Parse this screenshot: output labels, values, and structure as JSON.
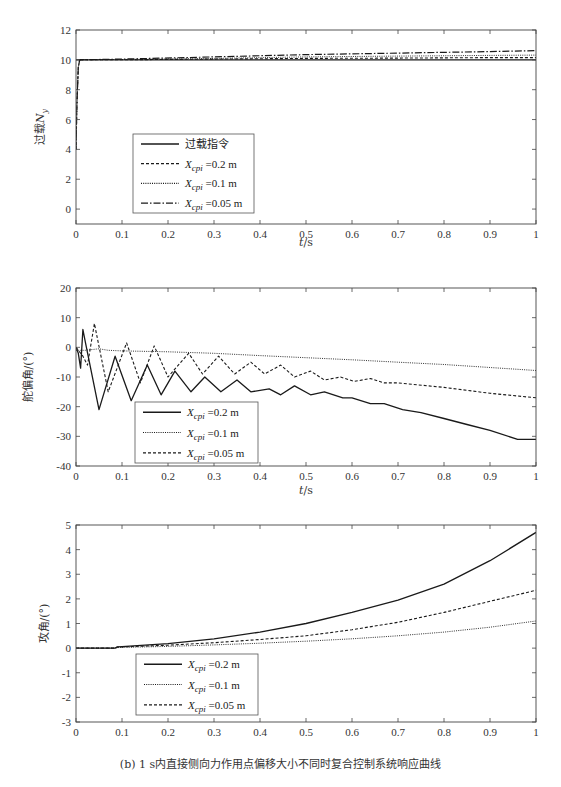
{
  "caption": "(b) 1 s内直接侧向力作用点偏移大小不同时复合控制系统响应曲线",
  "chart_data": [
    {
      "type": "line",
      "title": "",
      "xlabel": "t/s",
      "ylabel": "过载N_y",
      "xlim": [
        0,
        1
      ],
      "ylim": [
        -1,
        12
      ],
      "xticks": [
        0,
        0.1,
        0.2,
        0.3,
        0.4,
        0.5,
        0.6,
        0.7,
        0.8,
        0.9,
        1
      ],
      "yticks": [
        0,
        2,
        4,
        6,
        8,
        10,
        12
      ],
      "grid": false,
      "legend_position": "lower-left-inside",
      "series": [
        {
          "name": "过载指令",
          "style": "solid",
          "x": [
            0,
            0.004,
            0.008,
            0.05,
            1.0
          ],
          "y": [
            10,
            10,
            10,
            10,
            10
          ]
        },
        {
          "name": "X_cpi =0.2 m",
          "style": "dashed",
          "x": [
            0,
            0.002,
            0.005,
            0.008,
            0.1,
            0.3,
            0.5,
            0.7,
            0.9,
            1.0
          ],
          "y": [
            4,
            7,
            9.5,
            10,
            10.0,
            10.05,
            10.1,
            10.12,
            10.15,
            10.15
          ]
        },
        {
          "name": "X_cpi =0.1 m",
          "style": "dotted",
          "x": [
            0,
            0.002,
            0.005,
            0.008,
            0.1,
            0.3,
            0.5,
            0.7,
            0.9,
            1.0
          ],
          "y": [
            4,
            7,
            9.5,
            10,
            10.02,
            10.1,
            10.2,
            10.25,
            10.3,
            10.32
          ]
        },
        {
          "name": "X_cpi =0.05 m",
          "style": "dashdot",
          "x": [
            0,
            0.002,
            0.005,
            0.008,
            0.1,
            0.3,
            0.5,
            0.7,
            0.9,
            1.0
          ],
          "y": [
            4,
            7,
            9.5,
            10,
            10.05,
            10.2,
            10.35,
            10.45,
            10.55,
            10.62
          ]
        }
      ],
      "legend": [
        "过载指令",
        "X_cpi =0.2 m",
        "X_cpi =0.1 m",
        "X_cpi =0.05 m"
      ]
    },
    {
      "type": "line",
      "title": "",
      "xlabel": "t/s",
      "ylabel": "舵偏角/(°)",
      "xlim": [
        0,
        1
      ],
      "ylim": [
        -40,
        20
      ],
      "xticks": [
        0,
        0.1,
        0.2,
        0.3,
        0.4,
        0.5,
        0.6,
        0.7,
        0.8,
        0.9,
        1
      ],
      "yticks": [
        -40,
        -30,
        -20,
        -10,
        0,
        10,
        20
      ],
      "grid": false,
      "legend_position": "lower-left-inside",
      "series": [
        {
          "name": "X_cpi =0.2 m",
          "style": "solid",
          "x": [
            0,
            0.005,
            0.01,
            0.015,
            0.02,
            0.05,
            0.085,
            0.12,
            0.155,
            0.185,
            0.215,
            0.25,
            0.28,
            0.315,
            0.35,
            0.38,
            0.42,
            0.445,
            0.475,
            0.51,
            0.54,
            0.58,
            0.6,
            0.64,
            0.67,
            0.71,
            0.75,
            0.8,
            0.85,
            0.9,
            0.96,
            1.0
          ],
          "y": [
            0,
            -2,
            -7,
            6,
            2,
            -21,
            -3,
            -18,
            -6,
            -16,
            -8,
            -15,
            -10,
            -15,
            -11,
            -15,
            -14,
            -16,
            -13,
            -16,
            -15,
            -17,
            -17,
            -19,
            -19,
            -21,
            -22,
            -24,
            -26,
            -28,
            -31,
            -31
          ]
        },
        {
          "name": "X_cpi =0.1 m",
          "style": "dotted",
          "x": [
            0,
            0.02,
            0.05,
            0.07,
            0.1,
            0.2,
            0.3,
            0.4,
            0.5,
            0.6,
            0.7,
            0.8,
            0.9,
            1.0
          ],
          "y": [
            -1,
            -1,
            -0.5,
            -1,
            -1.2,
            -1.5,
            -2,
            -2.8,
            -3.5,
            -4.2,
            -5,
            -5.8,
            -6.8,
            -7.8
          ]
        },
        {
          "name": "X_cpi =0.05 m",
          "style": "dashed",
          "x": [
            0,
            0.015,
            0.025,
            0.04,
            0.07,
            0.11,
            0.14,
            0.17,
            0.2,
            0.245,
            0.275,
            0.31,
            0.345,
            0.38,
            0.41,
            0.445,
            0.475,
            0.51,
            0.54,
            0.575,
            0.605,
            0.64,
            0.67,
            0.7,
            0.8,
            0.9,
            1.0
          ],
          "y": [
            0,
            -3,
            -6,
            8,
            -15,
            1.5,
            -12,
            0.5,
            -10,
            -2,
            -9,
            -3,
            -9,
            -5,
            -9,
            -6,
            -10,
            -8,
            -11,
            -10,
            -11.5,
            -10.5,
            -12,
            -12,
            -13.5,
            -15.5,
            -17
          ]
        }
      ],
      "legend": [
        "X_cpi =0.2 m",
        "X_cpi =0.1 m",
        "X_cpi =0.05 m"
      ]
    },
    {
      "type": "line",
      "title": "",
      "xlabel": "",
      "ylabel": "攻角/(°)",
      "xlim": [
        0,
        1
      ],
      "ylim": [
        -3,
        5
      ],
      "xticks": [
        0,
        0.1,
        0.2,
        0.3,
        0.4,
        0.5,
        0.6,
        0.7,
        0.8,
        0.9,
        1
      ],
      "yticks": [
        -3,
        -2,
        -1,
        0,
        1,
        2,
        3,
        4,
        5
      ],
      "grid": false,
      "legend_position": "lower-left-inside",
      "series": [
        {
          "name": "X_cpi =0.2 m",
          "style": "solid",
          "x": [
            0,
            0.085,
            0.09,
            0.1,
            0.2,
            0.3,
            0.4,
            0.5,
            0.6,
            0.7,
            0.8,
            0.9,
            1.0
          ],
          "y": [
            0,
            0,
            0.05,
            0.06,
            0.18,
            0.38,
            0.65,
            1.0,
            1.45,
            1.95,
            2.6,
            3.55,
            4.7
          ]
        },
        {
          "name": "X_cpi =0.1 m",
          "style": "dotted",
          "x": [
            0,
            0.085,
            0.09,
            0.1,
            0.2,
            0.3,
            0.4,
            0.5,
            0.6,
            0.7,
            0.8,
            0.9,
            1.0
          ],
          "y": [
            0,
            0,
            0.02,
            0.03,
            0.07,
            0.13,
            0.2,
            0.28,
            0.38,
            0.5,
            0.65,
            0.85,
            1.1
          ]
        },
        {
          "name": "X_cpi =0.05 m",
          "style": "dashed",
          "x": [
            0,
            0.085,
            0.09,
            0.1,
            0.2,
            0.3,
            0.4,
            0.5,
            0.6,
            0.7,
            0.8,
            0.9,
            1.0
          ],
          "y": [
            0,
            0,
            0.04,
            0.05,
            0.12,
            0.22,
            0.35,
            0.5,
            0.75,
            1.05,
            1.45,
            1.9,
            2.35
          ]
        }
      ],
      "legend": [
        "X_cpi =0.2 m",
        "X_cpi =0.1 m",
        "X_cpi =0.05 m"
      ]
    }
  ],
  "layout": {
    "plot_left": 76,
    "plot_right": 536,
    "panels": [
      {
        "top": 30,
        "bottom": 224,
        "legend": {
          "x": 133,
          "y": 134,
          "w": 121,
          "h": 79
        },
        "xlabel_y": 246,
        "ylabel_x": 44
      },
      {
        "top": 288,
        "bottom": 466,
        "legend": {
          "x": 135,
          "y": 402,
          "w": 123,
          "h": 61
        },
        "xlabel_y": 494,
        "ylabel_x": 32
      },
      {
        "top": 525,
        "bottom": 722,
        "legend": {
          "x": 136,
          "y": 654,
          "w": 122,
          "h": 61
        },
        "xlabel_y": null,
        "ylabel_x": 48
      }
    ]
  }
}
